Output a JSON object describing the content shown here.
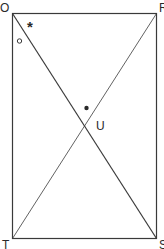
{
  "diagram": {
    "type": "rectangle-with-diagonals",
    "vertices": {
      "top_left": "O",
      "top_right": "R",
      "bottom_left": "T",
      "bottom_right": "S"
    },
    "intersection_label": "U",
    "markers": {
      "asterisk": "*",
      "circle": "open-circle",
      "dot": "filled-dot"
    },
    "colors": {
      "stroke": "#3a3a3a",
      "background": "#ffffff"
    }
  }
}
